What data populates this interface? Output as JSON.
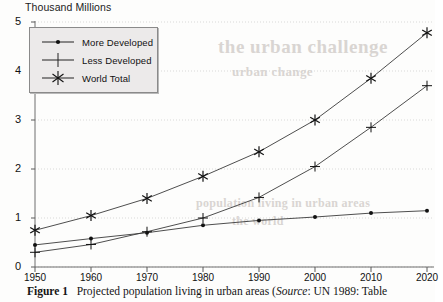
{
  "chart_data": {
    "type": "line",
    "title": "Thousand Millions",
    "xlabel": "",
    "ylabel": "Thousand Millions",
    "categories": [
      1950,
      1960,
      1970,
      1980,
      1990,
      2000,
      2010,
      2020
    ],
    "xticklabels": [
      "1950",
      "1960",
      "1970",
      "1980",
      "1990",
      "2000",
      "2010",
      "2020"
    ],
    "yticklabels": [
      "0",
      "1",
      "2",
      "3",
      "4",
      "5"
    ],
    "xlim": [
      1950,
      2020
    ],
    "ylim": [
      0,
      5
    ],
    "grid": true,
    "legend_position": "upper-left",
    "series": [
      {
        "name": "More Developed",
        "marker": "dot",
        "values": [
          0.45,
          0.58,
          0.7,
          0.85,
          0.95,
          1.02,
          1.1,
          1.15
        ]
      },
      {
        "name": "Less Developed",
        "marker": "plus",
        "values": [
          0.3,
          0.46,
          0.72,
          1.0,
          1.42,
          2.05,
          2.85,
          3.7
        ]
      },
      {
        "name": "World Total",
        "marker": "star",
        "values": [
          0.75,
          1.05,
          1.4,
          1.85,
          2.35,
          3.0,
          3.85,
          4.78
        ]
      }
    ]
  },
  "caption": {
    "figure_label": "Figure 1",
    "text_before_source": "Projected population living in urban areas (",
    "source_label": "Source",
    "text_after_source": ": UN 1989: Table"
  },
  "bleed_through": {
    "line1": "the urban challenge",
    "line2": "urban change",
    "line3": "population living in urban areas",
    "line4": "the world"
  }
}
